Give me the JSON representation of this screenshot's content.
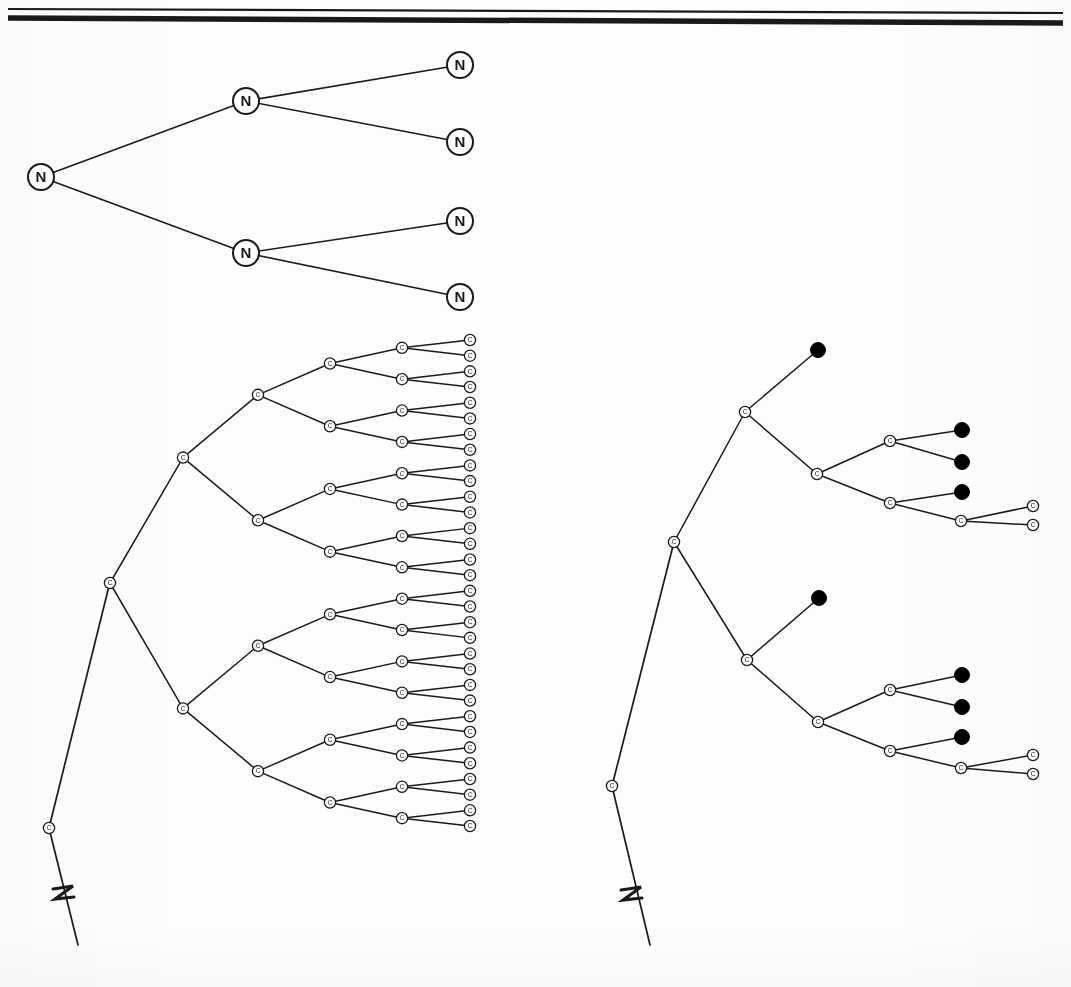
{
  "figure": {
    "background_color": "#fdfdfd",
    "ink_color": "#1a1a1a",
    "node_fill": "#ffffff",
    "dead_node_color": "#000000",
    "rule": {
      "thin_line": {
        "x1": 8,
        "y1": 9,
        "x2": 1063,
        "y2": 13,
        "width": 2.2
      },
      "thick_line": {
        "x1": 8,
        "y1": 18,
        "x2": 1063,
        "y2": 23,
        "width": 5.5
      }
    },
    "trees": [
      {
        "id": "top-n-tree",
        "name": "nondeterministic-computation-tree",
        "node_label": "N",
        "node_radius": 13,
        "label_font_size": 15,
        "nodes": [
          {
            "id": "n0",
            "x": 41,
            "y": 177,
            "label": "N",
            "kind": "open"
          },
          {
            "id": "n1",
            "x": 246,
            "y": 101,
            "label": "N",
            "kind": "open"
          },
          {
            "id": "n2",
            "x": 246,
            "y": 253,
            "label": "N",
            "kind": "open"
          },
          {
            "id": "n3",
            "x": 460,
            "y": 65,
            "label": "N",
            "kind": "open"
          },
          {
            "id": "n4",
            "x": 460,
            "y": 142,
            "label": "N",
            "kind": "open"
          },
          {
            "id": "n5",
            "x": 460,
            "y": 221,
            "label": "N",
            "kind": "open"
          },
          {
            "id": "n6",
            "x": 460,
            "y": 297,
            "label": "N",
            "kind": "open"
          }
        ],
        "edges": [
          [
            "n0",
            "n1"
          ],
          [
            "n0",
            "n2"
          ],
          [
            "n1",
            "n3"
          ],
          [
            "n1",
            "n4"
          ],
          [
            "n2",
            "n5"
          ],
          [
            "n2",
            "n6"
          ]
        ],
        "stroke_width": 1.6
      },
      {
        "id": "left-c-tree",
        "name": "full-configuration-tree",
        "node_label": "C",
        "node_radius": 5.6,
        "label_font_size": 6.5,
        "stroke_width": 1.5,
        "trunk": {
          "stem_bottom": {
            "x": 78,
            "y": 945
          },
          "break_node": {
            "x": 49,
            "y": 828,
            "label": "C"
          },
          "root": {
            "x": 110,
            "y": 582,
            "label": "C"
          },
          "break_mark": {
            "x": 64,
            "y": 895,
            "glyph": "zigzag"
          }
        },
        "levels_x": [
          110,
          183,
          258,
          330,
          402,
          470
        ],
        "leaf_count": 32,
        "leaf_top_y": 340,
        "leaf_bottom_y": 826
      },
      {
        "id": "right-c-tree",
        "name": "pruned-configuration-tree",
        "node_label": "C",
        "node_radius": 5.6,
        "dead_radius": 7.5,
        "label_font_size": 6.5,
        "stroke_width": 1.5,
        "trunk": {
          "stem_bottom": {
            "x": 650,
            "y": 945
          },
          "break_node": {
            "x": 612,
            "y": 786,
            "label": "C"
          },
          "root": {
            "x": 674,
            "y": 542,
            "label": "C"
          },
          "break_mark": {
            "x": 632,
            "y": 896,
            "glyph": "zigzag"
          }
        },
        "nodes": [
          {
            "id": "r0",
            "x": 674,
            "y": 542,
            "label": "C",
            "kind": "open"
          },
          {
            "id": "rA",
            "x": 745,
            "y": 412,
            "label": "C",
            "kind": "open"
          },
          {
            "id": "rA1",
            "x": 818,
            "y": 350,
            "label": "",
            "kind": "dead"
          },
          {
            "id": "rB",
            "x": 817,
            "y": 474,
            "label": "C",
            "kind": "open"
          },
          {
            "id": "rB1",
            "x": 890,
            "y": 441,
            "label": "C",
            "kind": "open"
          },
          {
            "id": "rB1a",
            "x": 962,
            "y": 430,
            "label": "",
            "kind": "dead"
          },
          {
            "id": "rB1b",
            "x": 962,
            "y": 462,
            "label": "",
            "kind": "dead"
          },
          {
            "id": "rB2",
            "x": 890,
            "y": 503,
            "label": "C",
            "kind": "open"
          },
          {
            "id": "rB2a",
            "x": 962,
            "y": 492,
            "label": "",
            "kind": "dead"
          },
          {
            "id": "rB2b",
            "x": 961,
            "y": 521,
            "label": "C",
            "kind": "open"
          },
          {
            "id": "rB2c",
            "x": 1033,
            "y": 506,
            "label": "C",
            "kind": "open"
          },
          {
            "id": "rB2d",
            "x": 1033,
            "y": 525,
            "label": "C",
            "kind": "open"
          },
          {
            "id": "rC",
            "x": 747,
            "y": 660,
            "label": "C",
            "kind": "open"
          },
          {
            "id": "rC1",
            "x": 819,
            "y": 598,
            "label": "",
            "kind": "dead"
          },
          {
            "id": "rD",
            "x": 818,
            "y": 722,
            "label": "C",
            "kind": "open"
          },
          {
            "id": "rD1",
            "x": 890,
            "y": 690,
            "label": "C",
            "kind": "open"
          },
          {
            "id": "rD1a",
            "x": 962,
            "y": 675,
            "label": "",
            "kind": "dead"
          },
          {
            "id": "rD1b",
            "x": 962,
            "y": 707,
            "label": "",
            "kind": "dead"
          },
          {
            "id": "rD2",
            "x": 890,
            "y": 751,
            "label": "C",
            "kind": "open"
          },
          {
            "id": "rD2a",
            "x": 962,
            "y": 737,
            "label": "",
            "kind": "dead"
          },
          {
            "id": "rD2b",
            "x": 961,
            "y": 768,
            "label": "C",
            "kind": "open"
          },
          {
            "id": "rD2c",
            "x": 1033,
            "y": 755,
            "label": "C",
            "kind": "open"
          },
          {
            "id": "rD2d",
            "x": 1033,
            "y": 774,
            "label": "C",
            "kind": "open"
          }
        ],
        "edges": [
          [
            "r0",
            "rA"
          ],
          [
            "r0",
            "rC"
          ],
          [
            "rA",
            "rA1"
          ],
          [
            "rA",
            "rB"
          ],
          [
            "rB",
            "rB1"
          ],
          [
            "rB",
            "rB2"
          ],
          [
            "rB1",
            "rB1a"
          ],
          [
            "rB1",
            "rB1b"
          ],
          [
            "rB2",
            "rB2a"
          ],
          [
            "rB2",
            "rB2b"
          ],
          [
            "rB2b",
            "rB2c"
          ],
          [
            "rB2b",
            "rB2d"
          ],
          [
            "rC",
            "rC1"
          ],
          [
            "rC",
            "rD"
          ],
          [
            "rD",
            "rD1"
          ],
          [
            "rD",
            "rD2"
          ],
          [
            "rD1",
            "rD1a"
          ],
          [
            "rD1",
            "rD1b"
          ],
          [
            "rD2",
            "rD2a"
          ],
          [
            "rD2",
            "rD2b"
          ],
          [
            "rD2b",
            "rD2c"
          ],
          [
            "rD2b",
            "rD2d"
          ]
        ]
      }
    ],
    "legend_semantics": {
      "open_circle_N": "nondeterministic branch node",
      "open_circle_C": "configuration node",
      "filled_dot": "terminated / rejecting branch"
    }
  }
}
